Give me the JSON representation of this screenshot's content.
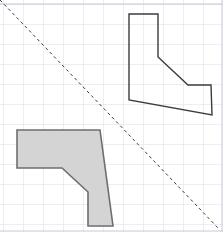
{
  "canvas": {
    "width": 223,
    "height": 232,
    "background_color": "#ffffff",
    "description": "Geometry reflection worksheet: an outlined L-shaped polygon and its gray-filled reflected image across a dashed diagonal mirror line on a grid."
  },
  "grid": {
    "label": "grid-background",
    "spacing_px": 20,
    "minor_spacing_px": 20,
    "line_color": "#d7dde8",
    "edge_line_color": "#c3cad6",
    "visible": true,
    "origin_offset_x": 3,
    "origin_offset_y": 4
  },
  "mirror_line": {
    "label": "mirror-line",
    "style": "dashed",
    "color": "#3a3a3a",
    "stroke_width": 1,
    "dash_pattern": "3 3",
    "x1": 0,
    "y1": 0,
    "x2": 219,
    "y2": 229
  },
  "shapes": [
    {
      "id": "outline-polygon",
      "label": "preimage-outline-polygon",
      "fill": "none",
      "fill_color": "#ffffff",
      "stroke_color": "#3c3c3c",
      "stroke_width": 1.4,
      "points": "129,14 158,14 158,57 188,85 211,85 212,115 129,100",
      "vertices": [
        [
          129,
          14
        ],
        [
          158,
          14
        ],
        [
          158,
          57
        ],
        [
          188,
          85
        ],
        [
          211,
          85
        ],
        [
          212,
          115
        ],
        [
          129,
          100
        ]
      ]
    },
    {
      "id": "filled-polygon",
      "label": "image-filled-polygon",
      "fill": "solid",
      "fill_color": "#d4d4d4",
      "stroke_color": "#6e6e6e",
      "stroke_width": 1.6,
      "points": "17,130 100,130 113,226 88,226 88,192 62,168 17,168",
      "vertices": [
        [
          17,
          130
        ],
        [
          100,
          130
        ],
        [
          113,
          226
        ],
        [
          88,
          226
        ],
        [
          88,
          192
        ],
        [
          62,
          168
        ],
        [
          17,
          168
        ]
      ]
    }
  ],
  "colors": {
    "grid_line": "#d7dde8",
    "outline_stroke": "#3c3c3c",
    "filled_fill": "#d4d4d4",
    "filled_stroke": "#6e6e6e",
    "mirror_dash": "#3a3a3a",
    "page_background": "#ffffff"
  }
}
